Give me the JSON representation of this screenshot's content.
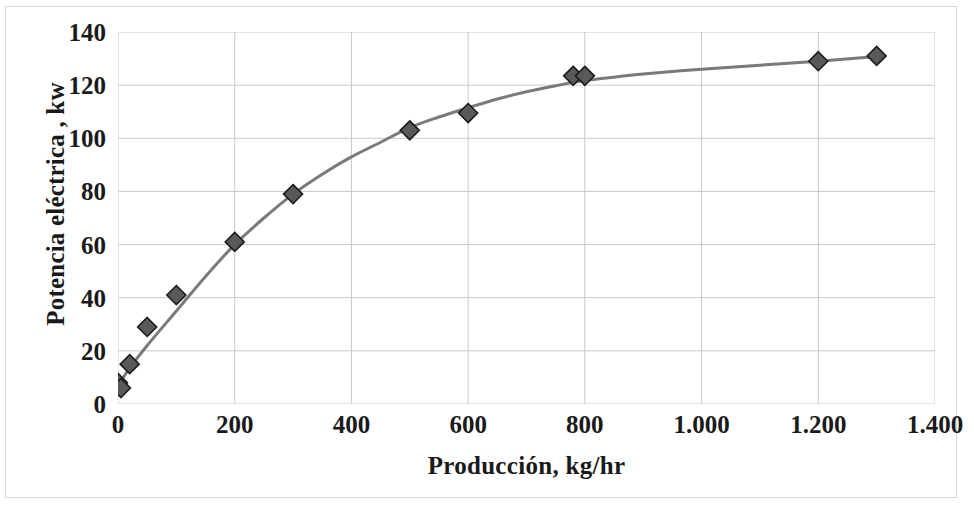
{
  "chart_data": {
    "type": "scatter",
    "title": "",
    "subtitle": "",
    "xlabel": "Producción, kg/hr",
    "ylabel": "Potencia eléctrica , kw",
    "xlim": [
      0,
      1400
    ],
    "ylim": [
      0,
      140
    ],
    "xticks": [
      0,
      200,
      400,
      600,
      800,
      1000,
      1200,
      1400
    ],
    "xtick_labels": [
      "0",
      "200",
      "400",
      "600",
      "800",
      "1.000",
      "1.200",
      "1.400"
    ],
    "yticks": [
      0,
      20,
      40,
      60,
      80,
      100,
      120,
      140
    ],
    "ytick_labels": [
      "0",
      "20",
      "40",
      "60",
      "80",
      "100",
      "120",
      "140"
    ],
    "grid": true,
    "grid_color": "#c9c9c9",
    "legend": null,
    "legend_position": "none",
    "marker_shape": "diamond",
    "marker_color": "#595959",
    "marker_edge_color": "#1c1c1c",
    "line_color": "#7a7a7a",
    "line_width": 3,
    "series": [
      {
        "name": "Potencia eléctrica",
        "points": [
          {
            "x": 0,
            "y": 8
          },
          {
            "x": 5,
            "y": 6
          },
          {
            "x": 20,
            "y": 15
          },
          {
            "x": 50,
            "y": 29
          },
          {
            "x": 100,
            "y": 41
          },
          {
            "x": 200,
            "y": 61
          },
          {
            "x": 300,
            "y": 79
          },
          {
            "x": 500,
            "y": 103
          },
          {
            "x": 600,
            "y": 109.5
          },
          {
            "x": 780,
            "y": 123.5
          },
          {
            "x": 800,
            "y": 123.5
          },
          {
            "x": 1200,
            "y": 129
          },
          {
            "x": 1300,
            "y": 131
          }
        ]
      }
    ],
    "fit_curve": [
      {
        "x": 0,
        "y": 7
      },
      {
        "x": 20,
        "y": 13.5
      },
      {
        "x": 50,
        "y": 22
      },
      {
        "x": 100,
        "y": 35
      },
      {
        "x": 150,
        "y": 48
      },
      {
        "x": 200,
        "y": 60
      },
      {
        "x": 250,
        "y": 70
      },
      {
        "x": 300,
        "y": 79
      },
      {
        "x": 350,
        "y": 86.5
      },
      {
        "x": 400,
        "y": 93
      },
      {
        "x": 450,
        "y": 98.5
      },
      {
        "x": 500,
        "y": 104
      },
      {
        "x": 550,
        "y": 108
      },
      {
        "x": 600,
        "y": 111.5
      },
      {
        "x": 650,
        "y": 114.8
      },
      {
        "x": 700,
        "y": 117.5
      },
      {
        "x": 750,
        "y": 119.8
      },
      {
        "x": 800,
        "y": 121.7
      },
      {
        "x": 850,
        "y": 123
      },
      {
        "x": 900,
        "y": 124.2
      },
      {
        "x": 1000,
        "y": 126
      },
      {
        "x": 1100,
        "y": 127.5
      },
      {
        "x": 1200,
        "y": 129
      },
      {
        "x": 1300,
        "y": 130.8
      }
    ]
  }
}
